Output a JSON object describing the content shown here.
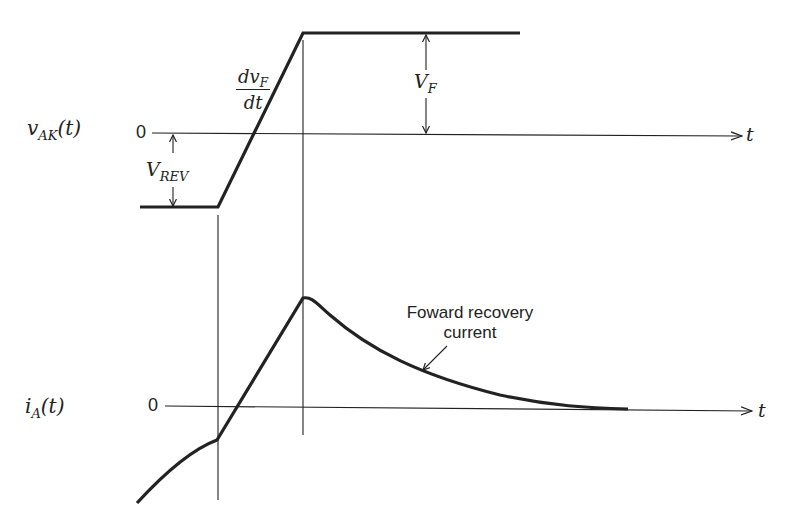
{
  "diagram": {
    "upper_plot": {
      "ylabel": "v",
      "ylabel_sub": "AK",
      "ylabel_arg": "(t)",
      "zero_label": "0",
      "xaxis_label": "t",
      "annotations": {
        "slope_num": "dv",
        "slope_num_sub": "F",
        "slope_den": "dt",
        "forward_voltage": "V",
        "forward_voltage_sub": "F",
        "reverse_voltage": "V",
        "reverse_voltage_sub": "REV"
      }
    },
    "lower_plot": {
      "ylabel": "i",
      "ylabel_sub": "A",
      "ylabel_arg": "(t)",
      "zero_label": "0",
      "xaxis_label": "t",
      "callout_line1": "Foward recovery",
      "callout_line2": "current"
    },
    "colors": {
      "ink": "#222222",
      "background": "#ffffff"
    }
  }
}
